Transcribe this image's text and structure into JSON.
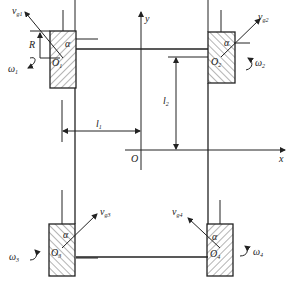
{
  "diagram": {
    "type": "mecanum-wheel-kinematics",
    "axes": {
      "x_label": "x",
      "y_label": "y",
      "origin_label": "O"
    },
    "dimensions": {
      "l1_label": "l",
      "l1_sub": "1",
      "l2_label": "l",
      "l2_sub": "2",
      "radius_label": "R"
    },
    "angle_label": "α",
    "wheels": [
      {
        "center_label": "O",
        "center_sub": "1",
        "velocity_label": "v",
        "velocity_sub": "g1",
        "omega_label": "ω",
        "omega_sub": "1"
      },
      {
        "center_label": "O",
        "center_sub": "2",
        "velocity_label": "v",
        "velocity_sub": "g2",
        "omega_label": "ω",
        "omega_sub": "2"
      },
      {
        "center_label": "O",
        "center_sub": "3",
        "velocity_label": "v",
        "velocity_sub": "g3",
        "omega_label": "ω",
        "omega_sub": "3"
      },
      {
        "center_label": "O",
        "center_sub": "4",
        "velocity_label": "v",
        "velocity_sub": "g4",
        "omega_label": "ω",
        "omega_sub": "4"
      }
    ]
  }
}
